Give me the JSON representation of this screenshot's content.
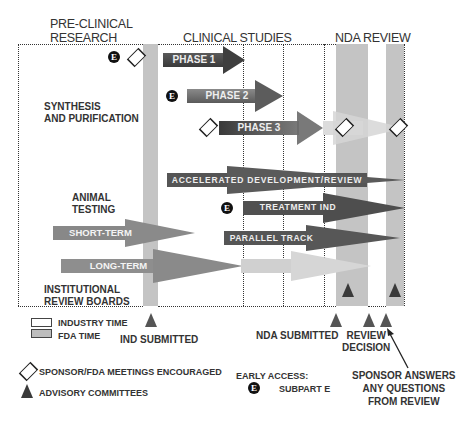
{
  "headers": {
    "preclinical_line1": "PRE-CLINICAL",
    "preclinical_line2": "RESEARCH",
    "clinical": "CLINICAL STUDIES",
    "nda": "NDA REVIEW"
  },
  "left_labels": {
    "synthesis_line1": "SYNTHESIS",
    "synthesis_line2": "AND PURIFICATION",
    "animal_line1": "ANIMAL",
    "animal_line2": "TESTING",
    "irb_line1": "INSTITUTIONAL",
    "irb_line2": "REVIEW BOARDS"
  },
  "arrows": {
    "phase1": "PHASE 1",
    "phase2": "PHASE 2",
    "phase3": "PHASE 3",
    "accelerated": "ACCELERATED DEVELOPMENT/REVIEW",
    "treatment_ind": "TREATMENT IND",
    "parallel_track": "PARALLEL TRACK",
    "short_term": "SHORT-TERM",
    "long_term": "LONG-TERM"
  },
  "badges": {
    "e": "E"
  },
  "milestones": {
    "ind_submitted": "IND SUBMITTED",
    "nda_submitted": "NDA SUBMITTED",
    "review_line1": "REVIEW",
    "review_line2": "DECISION",
    "sponsor_line1": "SPONSOR ANSWERS",
    "sponsor_line2": "ANY QUESTIONS",
    "sponsor_line3": "FROM REVIEW"
  },
  "legend": {
    "industry_time": "INDUSTRY TIME",
    "fda_time": "FDA TIME",
    "meetings": "SPONSOR/FDA MEETINGS ENCOURAGED",
    "advisory": "ADVISORY COMMITTEES",
    "early_access": "EARLY ACCESS:",
    "subpart_e": "SUBPART E"
  },
  "colors": {
    "fda_bar": "#c4c4c4",
    "arrow_dark": "#4a4a4a",
    "arrow_mid": "#6e6e6e",
    "arrow_light": "#a8a8a8",
    "arrow_pale": "#d4d4d4"
  }
}
